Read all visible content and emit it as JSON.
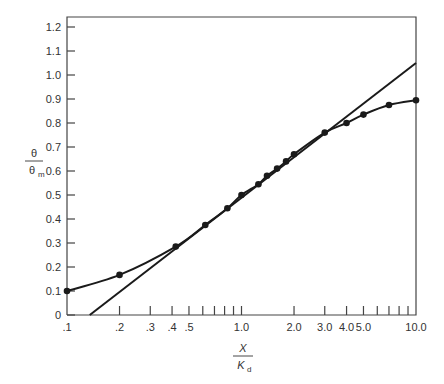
{
  "chart_data": {
    "type": "line",
    "title": "",
    "xlabel": "X / K_d",
    "ylabel": "θ / θ_m",
    "xlabel_parts": {
      "numerator": "X",
      "denominator": "K",
      "subscript": "d"
    },
    "ylabel_parts": {
      "numerator": "θ",
      "denominator": "θ",
      "subscript": "m"
    },
    "xscale": "log",
    "xlim": [
      0.1,
      10.0
    ],
    "ylim": [
      0,
      1.2
    ],
    "grid": false,
    "legend": null,
    "x_tick_labels": [
      ".1",
      ".2",
      ".3",
      ".4",
      ".5",
      "1.0",
      "2.0",
      "3.0",
      "4.0",
      "5.0",
      "10.0"
    ],
    "x_tick_values": [
      0.1,
      0.2,
      0.3,
      0.4,
      0.5,
      1.0,
      2.0,
      3.0,
      4.0,
      5.0,
      10.0
    ],
    "x_minor_ticks": [
      0.6,
      0.7,
      0.8,
      0.9,
      6.0,
      7.0,
      8.0,
      9.0
    ],
    "y_tick_labels": [
      "0",
      "0.1",
      "0.2",
      "0.3",
      "0.4",
      "0.5",
      "0.6",
      "0.7",
      "0.8",
      "0.9",
      "1.0",
      "1.1",
      "1.2"
    ],
    "y_tick_values": [
      0,
      0.1,
      0.2,
      0.3,
      0.4,
      0.5,
      0.6,
      0.7,
      0.8,
      0.9,
      1.0,
      1.1,
      1.2
    ],
    "series": [
      {
        "name": "data (curve with points)",
        "style": "curve-with-markers",
        "x": [
          0.1,
          0.2,
          0.42,
          0.62,
          0.83,
          1.0,
          1.25,
          1.4,
          1.6,
          1.8,
          2.0,
          3.0,
          4.0,
          5.0,
          7.0,
          10.0
        ],
        "y": [
          0.1,
          0.167,
          0.285,
          0.375,
          0.445,
          0.5,
          0.545,
          0.58,
          0.61,
          0.64,
          0.67,
          0.76,
          0.8,
          0.835,
          0.875,
          0.895
        ]
      },
      {
        "name": "linear fit (straight line)",
        "style": "line",
        "x": [
          0.135,
          10.0
        ],
        "y": [
          0.0,
          1.05
        ]
      }
    ]
  }
}
